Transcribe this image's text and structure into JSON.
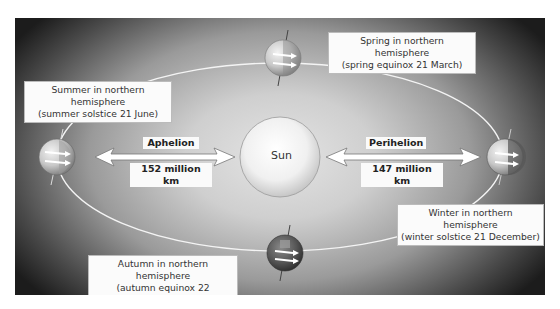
{
  "diagram": {
    "sun": {
      "label": "Sun"
    },
    "aphelion": {
      "label": "Aphelion",
      "distance": "152 million km"
    },
    "perihelion": {
      "label": "Perihelion",
      "distance": "147 million km"
    },
    "seasons": [
      {
        "id": "summer",
        "line1": "Summer in northern hemisphere",
        "line2": "(summer solstice 21 June)"
      },
      {
        "id": "spring",
        "line1": "Spring in northern hemisphere",
        "line2": "(spring equinox 21 March)"
      },
      {
        "id": "winter",
        "line1": "Winter in northern hemisphere",
        "line2": "(winter solstice 21 December)"
      },
      {
        "id": "autumn",
        "line1": "Autumn in northern hemisphere",
        "line2": "(autumn equinox 22 September)"
      }
    ],
    "colors": {
      "panel_edge": "#1c1c1c",
      "panel_center": "#e4e4e4",
      "orbit": "#f4f4f4",
      "label_bg": "#fbfbfb"
    }
  }
}
